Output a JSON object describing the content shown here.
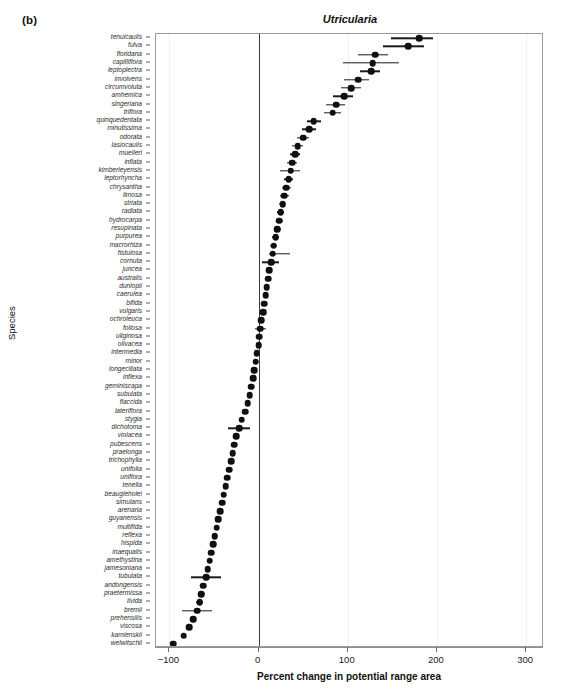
{
  "panel": {
    "label": "(b)"
  },
  "axis_title_y": "Species",
  "caption_fragment": "",
  "chart_data": {
    "type": "scatter",
    "title": "Utricularia",
    "xlabel": "Percent change in potential range area",
    "ylabel": "Species",
    "xlim": [
      -115,
      320
    ],
    "xticks": [
      -100,
      0,
      100,
      200,
      300
    ],
    "xticklabels": [
      "−100",
      "0",
      "100",
      "200",
      "300"
    ],
    "grid": false,
    "zero_reference_line": 0,
    "marker": "filled-circle",
    "error_bar_orientation": "horizontal",
    "categories": [
      "tenuicaulis",
      "fulva",
      "floridana",
      "capilliflora",
      "leptoplectra",
      "involvens",
      "circumvoluta",
      "amhemica",
      "singeriana",
      "triflora",
      "quinquedentata",
      "minutissima",
      "odorata",
      "lasiocaulis",
      "muelleri",
      "inflata",
      "kimberleyensis",
      "leptorhyncha",
      "chrysantha",
      "limosa",
      "striata",
      "radiata",
      "hydrocarpa",
      "resupinata",
      "purpurea",
      "macrorhiza",
      "fistulosa",
      "cornuta",
      "juncea",
      "australis",
      "dunlopii",
      "caerulea",
      "bifida",
      "vulgaris",
      "ochroleuca",
      "foliosa",
      "uliginosa",
      "olivacea",
      "intermedia",
      "minor",
      "longeciliata",
      "inflexa",
      "geminiscapa",
      "subulata",
      "flaccida",
      "lateriflora",
      "stygia",
      "dichotoma",
      "violacea",
      "pubescens",
      "praelonga",
      "trichophylla",
      "unifolia",
      "uniflora",
      "tenella",
      "beaugleholei",
      "simulans",
      "arenaria",
      "guyanensis",
      "multifida",
      "reflexa",
      "hispida",
      "inaequalis",
      "amethystina",
      "jamesoniana",
      "tubulata",
      "andongensis",
      "praetermissa",
      "livida",
      "bremii",
      "prehensilis",
      "viscosa",
      "kamienskii",
      "welwitschii"
    ],
    "values": [
      180,
      168,
      131,
      128,
      126,
      112,
      104,
      96,
      87,
      83,
      62,
      57,
      50,
      44,
      41,
      38,
      36,
      34,
      31,
      29,
      27,
      25,
      23,
      21,
      19,
      17,
      16,
      14,
      12,
      11,
      9,
      8,
      6,
      5,
      3,
      2,
      1,
      0,
      -2,
      -3,
      -5,
      -6,
      -8,
      -10,
      -12,
      -15,
      -19,
      -22,
      -25,
      -27,
      -29,
      -31,
      -33,
      -35,
      -37,
      -39,
      -41,
      -43,
      -45,
      -47,
      -49,
      -51,
      -53,
      -55,
      -57,
      -59,
      -62,
      -64,
      -66,
      -69,
      -73,
      -78,
      -84,
      -96
    ],
    "err_low": [
      149,
      140,
      112,
      95,
      114,
      96,
      92,
      84,
      76,
      73,
      54,
      49,
      43,
      38,
      35,
      32,
      24,
      29,
      26,
      24,
      23,
      21,
      19,
      17,
      15,
      13,
      12,
      4,
      9,
      8,
      6,
      5,
      4,
      3,
      1,
      -4,
      -1,
      -2,
      -4,
      -5,
      -7,
      -8,
      -10,
      -12,
      -14,
      -17,
      -22,
      -34,
      -28,
      -30,
      -32,
      -34,
      -36,
      -38,
      -40,
      -42,
      -44,
      -46,
      -48,
      -50,
      -52,
      -54,
      -56,
      -58,
      -60,
      -76,
      -65,
      -68,
      -70,
      -86,
      -76,
      -81,
      -87,
      -98
    ],
    "err_high": [
      196,
      186,
      145,
      157,
      136,
      124,
      115,
      106,
      97,
      92,
      70,
      64,
      56,
      50,
      46,
      43,
      47,
      39,
      36,
      34,
      31,
      29,
      27,
      25,
      23,
      21,
      35,
      23,
      15,
      14,
      12,
      11,
      8,
      7,
      5,
      8,
      3,
      2,
      0,
      -1,
      -3,
      -4,
      -6,
      -8,
      -10,
      -13,
      -16,
      -10,
      -22,
      -24,
      -26,
      -28,
      -30,
      -32,
      -34,
      -36,
      -38,
      -40,
      -42,
      -44,
      -46,
      -48,
      -50,
      -52,
      -54,
      -42,
      -59,
      -60,
      -62,
      -52,
      -70,
      -75,
      -81,
      -94
    ]
  }
}
